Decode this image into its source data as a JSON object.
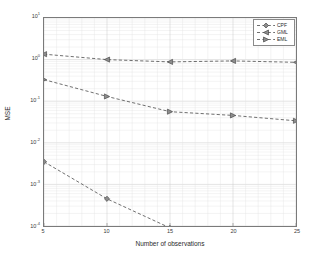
{
  "chart_data": {
    "type": "line",
    "title": "",
    "xlabel": "Number of observations",
    "ylabel": "MSE",
    "xlim": [
      5,
      25
    ],
    "ylim": [
      0.0001,
      10
    ],
    "yscale": "log",
    "grid": true,
    "legend_position": "top-right",
    "x": [
      5,
      10,
      15,
      20,
      25
    ],
    "xticks": [
      "5",
      "10",
      "15",
      "20",
      "25"
    ],
    "yticks": [
      {
        "label_base": "10",
        "label_exp": "1",
        "value": 10
      },
      {
        "label_base": "10",
        "label_exp": "0",
        "value": 1
      },
      {
        "label_base": "10",
        "label_exp": "-1",
        "value": 0.1
      },
      {
        "label_base": "10",
        "label_exp": "-2",
        "value": 0.01
      },
      {
        "label_base": "10",
        "label_exp": "-3",
        "value": 0.001
      },
      {
        "label_base": "10",
        "label_exp": "-4",
        "value": 0.0001
      }
    ],
    "series": [
      {
        "name": "CPF",
        "marker": "diamond",
        "linestyle": "dashed",
        "color": "#4a4a4a",
        "values": [
          0.0035,
          0.00045,
          9e-05,
          3.35e-05,
          3.1e-05
        ]
      },
      {
        "name": "GML",
        "marker": "triangle-left",
        "linestyle": "dashed",
        "color": "#4a4a4a",
        "values": [
          1.35,
          1.0,
          0.88,
          0.93,
          0.86
        ]
      },
      {
        "name": "EML",
        "marker": "triangle-right",
        "linestyle": "dashed",
        "color": "#4a4a4a",
        "values": [
          0.33,
          0.13,
          0.056,
          0.0455,
          0.0338
        ]
      }
    ]
  },
  "legend": {
    "items": [
      {
        "label": "CPF"
      },
      {
        "label": "GML"
      },
      {
        "label": "EML"
      }
    ]
  },
  "axes": {
    "xlabel": "Number of observations",
    "ylabel": "MSE"
  },
  "colors": {
    "axis": "#7a7a7a",
    "grid_major": "#c8c8c8",
    "grid_minor": "#e2e2e2",
    "data": "#4a4a4a",
    "text": "#2b2b2b",
    "background": "#ffffff"
  }
}
